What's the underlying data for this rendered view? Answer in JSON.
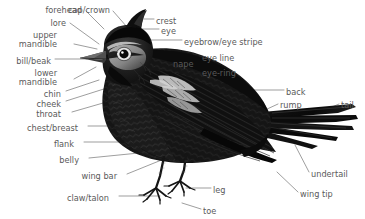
{
  "figure": {
    "kind": "bird-anatomy-diagram",
    "background_color": "#ffffff",
    "label_color": "#5a5a5a",
    "leader_line_color": "#8c8c8c",
    "illustration_ink": "#141414"
  },
  "labels": [
    {
      "id": "forehead",
      "text": "forehead",
      "align": "right",
      "x": 82,
      "y": 6
    },
    {
      "id": "cap-crown",
      "text": "cap/crown",
      "align": "left",
      "x": 68,
      "y": 6
    },
    {
      "id": "crest",
      "text": "crest",
      "align": "left",
      "x": 156,
      "y": 17
    },
    {
      "id": "eye",
      "text": "eye",
      "align": "left",
      "x": 161,
      "y": 27
    },
    {
      "id": "lore",
      "text": "lore",
      "align": "right",
      "x": 66,
      "y": 19
    },
    {
      "id": "eyebrow-eye-stripe",
      "text": "eyebrow/eye stripe",
      "align": "left",
      "x": 184,
      "y": 38
    },
    {
      "id": "upper-mandible",
      "text": "upper\nmandible",
      "align": "right",
      "x": 57,
      "y": 31
    },
    {
      "id": "eye-line",
      "text": "eye line",
      "align": "left",
      "x": 202,
      "y": 54
    },
    {
      "id": "nape",
      "text": "nape",
      "align": "left",
      "x": 173,
      "y": 60
    },
    {
      "id": "eye-ring",
      "text": "eye-ring",
      "align": "left",
      "x": 202,
      "y": 69
    },
    {
      "id": "bill-beak",
      "text": "bill/beak",
      "align": "right",
      "x": 51,
      "y": 57
    },
    {
      "id": "lower-mandible",
      "text": "lower\nmandible",
      "align": "right",
      "x": 57,
      "y": 69
    },
    {
      "id": "chin",
      "text": "chin",
      "align": "right",
      "x": 61,
      "y": 90
    },
    {
      "id": "back",
      "text": "back",
      "align": "left",
      "x": 286,
      "y": 88
    },
    {
      "id": "cheek",
      "text": "cheek",
      "align": "right",
      "x": 61,
      "y": 100
    },
    {
      "id": "rump",
      "text": "rump",
      "align": "left",
      "x": 280,
      "y": 101
    },
    {
      "id": "tail",
      "text": "tail",
      "align": "left",
      "x": 341,
      "y": 101
    },
    {
      "id": "throat",
      "text": "throat",
      "align": "right",
      "x": 61,
      "y": 110
    },
    {
      "id": "chest-breast",
      "text": "chest/breast",
      "align": "right",
      "x": 78,
      "y": 124
    },
    {
      "id": "flank",
      "text": "flank",
      "align": "right",
      "x": 74,
      "y": 140
    },
    {
      "id": "belly",
      "text": "belly",
      "align": "right",
      "x": 79,
      "y": 156
    },
    {
      "id": "wing-bar",
      "text": "wing bar",
      "align": "right",
      "x": 117,
      "y": 172
    },
    {
      "id": "undertail",
      "text": "undertail",
      "align": "left",
      "x": 311,
      "y": 170
    },
    {
      "id": "leg",
      "text": "leg",
      "align": "left",
      "x": 213,
      "y": 186
    },
    {
      "id": "claw-talon",
      "text": "claw/talon",
      "align": "right",
      "x": 109,
      "y": 194
    },
    {
      "id": "wing-tip",
      "text": "wing tip",
      "align": "left",
      "x": 300,
      "y": 190
    },
    {
      "id": "toe",
      "text": "toe",
      "align": "left",
      "x": 203,
      "y": 207
    }
  ],
  "leader_lines": [
    {
      "id": "leader-forehead",
      "points": "86,11 104,29"
    },
    {
      "id": "leader-cap-crown",
      "points": "113,11 127,27"
    },
    {
      "id": "leader-crest",
      "points": "154,19 136,19"
    },
    {
      "id": "leader-eye",
      "points": "159,29 140,29"
    },
    {
      "id": "leader-eyebrow-eye-stripe",
      "points": "182,40 131,40"
    },
    {
      "id": "leader-lore",
      "points": "70,23 99,44"
    },
    {
      "id": "leader-upper-mandible",
      "points": "74,44 97,49"
    },
    {
      "id": "leader-eye-line",
      "points": "200,56 150,49"
    },
    {
      "id": "leader-nape",
      "points": "171,62 132,62"
    },
    {
      "id": "leader-eye-ring",
      "points": "200,71 146,60"
    },
    {
      "id": "leader-bill-beak",
      "points": "55,59 87,59"
    },
    {
      "id": "leader-lower-mandible",
      "points": "74,79 96,67"
    },
    {
      "id": "leader-chin",
      "points": "66,91 99,80"
    },
    {
      "id": "leader-back",
      "points": "284,90 224,90"
    },
    {
      "id": "leader-cheek",
      "points": "66,101 107,88"
    },
    {
      "id": "leader-rump",
      "points": "278,104 265,110"
    },
    {
      "id": "leader-tail",
      "points": "339,104 318,113"
    },
    {
      "id": "leader-throat",
      "points": "72,112 110,101"
    },
    {
      "id": "leader-chest-breast",
      "points": "88,126 139,126"
    },
    {
      "id": "leader-flank",
      "points": "84,142 144,142"
    },
    {
      "id": "leader-belly",
      "points": "89,158 149,152"
    },
    {
      "id": "leader-wing-bar",
      "points": "127,174 164,159"
    },
    {
      "id": "leader-undertail",
      "points": "309,172 295,145"
    },
    {
      "id": "leader-leg",
      "points": "211,188 186,188"
    },
    {
      "id": "leader-claw-talon",
      "points": "119,196 160,196"
    },
    {
      "id": "leader-wing-tip",
      "points": "298,192 277,172"
    },
    {
      "id": "leader-toe",
      "points": "201,209 182,203"
    }
  ]
}
